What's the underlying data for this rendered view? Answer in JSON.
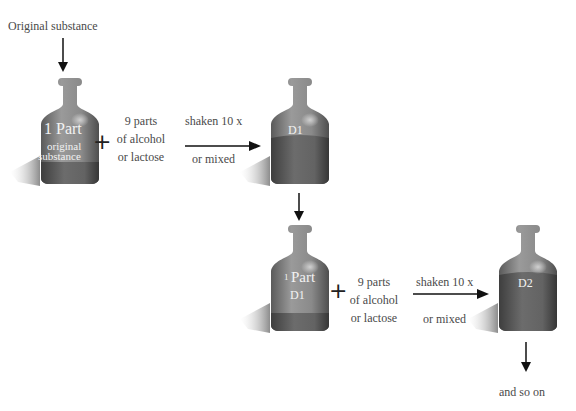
{
  "diagram": {
    "type": "process-flow",
    "title_label": "Original substance",
    "step1": {
      "bottle_main_label": "1 Part",
      "bottle_sub_label_line1": "original",
      "bottle_sub_label_line2": "substance",
      "plus": "+",
      "diluent_line1": "9 parts",
      "diluent_line2": "of alcohol",
      "diluent_line3": "or lactose",
      "action_top": "shaken 10 x",
      "action_bottom": "or mixed",
      "result_label": "D1"
    },
    "step2": {
      "bottle_main_label_num": "1",
      "bottle_main_label_word": "Part",
      "bottle_sub_label": "D1",
      "plus": "+",
      "diluent_line1": "9 parts",
      "diluent_line2": "of alcohol",
      "diluent_line3": "or lactose",
      "action_top": "shaken 10 x",
      "action_bottom": "or mixed",
      "result_label": "D2"
    },
    "footer_label": "and so on",
    "colors": {
      "bottle_body": "#8a8a8a",
      "bottle_liquid": "#5e5e5e",
      "bottle_label_text": "#f2f2f2",
      "arrow": "#111111",
      "text": "#4a4a4a"
    }
  }
}
